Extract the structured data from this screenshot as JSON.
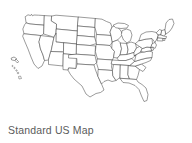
{
  "figure": {
    "caption": "Standard US Map",
    "background_color": "#ffffff",
    "outline_color": "#4a4a4a",
    "fill_color": "#ffffff",
    "caption_color": "#5b5b5b"
  },
  "map": {
    "title": "Standard US Map",
    "projection": "albers-usa",
    "region": "United States",
    "style": "outline-only state boundaries, no fill, no labels",
    "includes_insets": [
      "Alaska",
      "Hawaii"
    ],
    "state_count": 50,
    "labels_visible": false,
    "legend_visible": false,
    "states": [
      "Washington",
      "Oregon",
      "California",
      "Nevada",
      "Idaho",
      "Montana",
      "Wyoming",
      "Utah",
      "Arizona",
      "Colorado",
      "New Mexico",
      "North Dakota",
      "South Dakota",
      "Nebraska",
      "Kansas",
      "Oklahoma",
      "Texas",
      "Minnesota",
      "Iowa",
      "Missouri",
      "Arkansas",
      "Louisiana",
      "Wisconsin",
      "Illinois",
      "Michigan",
      "Indiana",
      "Ohio",
      "Kentucky",
      "Tennessee",
      "Mississippi",
      "Alabama",
      "Georgia",
      "Florida",
      "South Carolina",
      "North Carolina",
      "Virginia",
      "West Virginia",
      "Maryland",
      "Delaware",
      "Pennsylvania",
      "New Jersey",
      "New York",
      "Connecticut",
      "Rhode Island",
      "Massachusetts",
      "Vermont",
      "New Hampshire",
      "Maine",
      "Alaska",
      "Hawaii"
    ]
  }
}
